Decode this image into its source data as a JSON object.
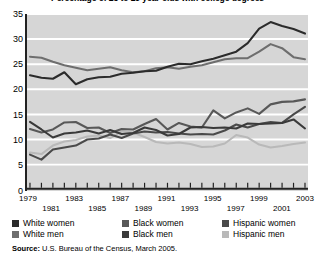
{
  "chart_data": {
    "type": "line",
    "title": "Percentage of 25 to 29 year olds with college degrees",
    "xlabel": "",
    "ylabel": "",
    "ylim": [
      0,
      35
    ],
    "ytick_step": 5,
    "yticks": [
      35,
      30,
      25,
      20,
      15,
      10,
      5,
      0
    ],
    "grid": true,
    "legend_position": "below-axis",
    "x": [
      1979,
      1980,
      1981,
      1982,
      1983,
      1984,
      1985,
      1986,
      1987,
      1988,
      1989,
      1990,
      1991,
      1992,
      1993,
      1994,
      1995,
      1996,
      1997,
      1998,
      1999,
      2000,
      2001,
      2002,
      2003
    ],
    "xtick_labels": [
      "1979",
      "1981",
      "1983",
      "1985",
      "1987",
      "1989",
      "1991",
      "1993",
      "1995",
      "1997",
      "1999",
      "2001",
      "2003"
    ],
    "series": [
      {
        "name": "White women",
        "color": "#2b2b2b",
        "values": [
          22.8,
          22.3,
          22.1,
          23.4,
          21.0,
          22.0,
          22.4,
          22.5,
          23.1,
          23.3,
          23.6,
          23.7,
          24.5,
          25.1,
          25.0,
          25.6,
          26.1,
          26.8,
          27.5,
          29.2,
          32.1,
          33.4,
          32.6,
          32.0,
          31.1
        ]
      },
      {
        "name": "White men",
        "color": "#6e6e6e",
        "values": [
          26.5,
          26.3,
          25.5,
          24.8,
          24.3,
          23.8,
          24.1,
          24.4,
          23.8,
          23.4,
          23.6,
          24.2,
          24.4,
          24.1,
          24.5,
          24.8,
          25.4,
          26.0,
          26.2,
          26.2,
          27.5,
          29.0,
          28.2,
          26.4,
          26.0
        ]
      },
      {
        "name": "Black women",
        "color": "#585858",
        "values": [
          12.1,
          11.4,
          12.0,
          13.4,
          13.5,
          12.3,
          12.4,
          11.3,
          12.1,
          12.0,
          13.1,
          14.1,
          12.0,
          13.3,
          12.6,
          12.4,
          15.8,
          14.2,
          15.4,
          16.2,
          15.1,
          17.0,
          17.5,
          17.6,
          18.0
        ]
      },
      {
        "name": "Black men",
        "color": "#3a3a3a",
        "values": [
          13.5,
          12.0,
          10.4,
          11.2,
          11.4,
          11.8,
          11.2,
          11.9,
          11.1,
          11.3,
          12.4,
          11.9,
          10.8,
          11.1,
          12.4,
          12.5,
          12.3,
          12.4,
          12.2,
          13.2,
          13.1,
          13.2,
          13.3,
          14.0,
          12.2
        ]
      },
      {
        "name": "Hispanic women",
        "color": "#4a4a4a",
        "values": [
          7.0,
          6.0,
          8.0,
          8.4,
          8.8,
          10.0,
          10.2,
          11.0,
          10.3,
          11.2,
          11.6,
          11.4,
          11.5,
          11.2,
          11.0,
          11.1,
          11.0,
          11.8,
          13.0,
          12.4,
          13.1,
          13.5,
          13.3,
          15.0,
          16.5
        ]
      },
      {
        "name": "Hispanic men",
        "color": "#b9b9b9",
        "values": [
          7.4,
          7.1,
          8.8,
          9.6,
          9.9,
          10.6,
          10.8,
          10.3,
          11.7,
          11.4,
          10.5,
          9.5,
          9.2,
          9.4,
          9.1,
          8.5,
          8.6,
          9.2,
          10.9,
          10.4,
          9.0,
          8.4,
          8.7,
          9.1,
          9.4
        ]
      }
    ]
  },
  "source": {
    "label": "Source:",
    "text": " U.S. Bureau of the Census, March 2005."
  },
  "colors": {
    "plot_background": "#d6d6d6",
    "gridline": "#ffffff",
    "axis": "#222222"
  }
}
